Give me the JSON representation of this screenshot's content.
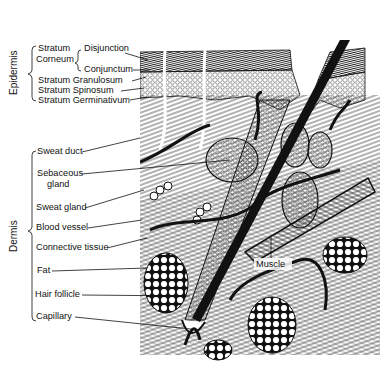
{
  "diagram": {
    "regions": {
      "epidermis": "Epidermis",
      "dermis": "Dermis"
    },
    "epidermis_labels": {
      "stratum_corneum": "Stratum\nCorneum",
      "stratum_corneum_line1": "Stratum",
      "stratum_corneum_line2": "Corneum",
      "disjunction": "Disjunction",
      "conjunctum": "Conjunctum",
      "granulosum": "Stratum Granulosum",
      "spinosum": "Stratum Spinosum",
      "germinativum": "Stratum Germinativum"
    },
    "dermis_labels": {
      "sweat_duct": "Sweat duct",
      "sebaceous_line1": "Sebaceous",
      "sebaceous_line2": "gland",
      "sweat_gland": "Sweat gland",
      "blood_vessel": "Blood vessel",
      "connective_tissue": "Connective tissue",
      "fat": "Fat",
      "hair_follicle": "Hair follicle",
      "capillary": "Capillary"
    },
    "other_labels": {
      "muscle": "Muscle"
    },
    "colors": {
      "ink": "#111111",
      "background": "#ffffff"
    }
  }
}
